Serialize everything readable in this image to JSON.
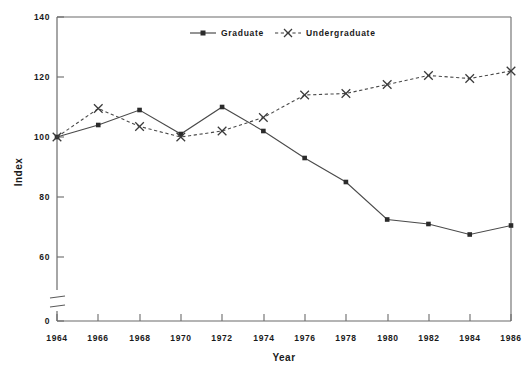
{
  "chart_data": {
    "type": "line",
    "title": "",
    "xlabel": "Year",
    "ylabel": "Index",
    "x": [
      1964,
      1966,
      1968,
      1970,
      1972,
      1974,
      1976,
      1978,
      1980,
      1982,
      1984,
      1986
    ],
    "xtick_labels": [
      "1964",
      "1966",
      "1968",
      "1970",
      "1972",
      "1974",
      "1976",
      "1978",
      "1980",
      "1982",
      "1984",
      "1986"
    ],
    "ytick_labels": [
      "0",
      "60",
      "80",
      "100",
      "120",
      "140"
    ],
    "ytick_values": [
      0,
      60,
      80,
      100,
      120,
      140
    ],
    "ylim": [
      60,
      140
    ],
    "axis_break": true,
    "axis_break_note": "y-axis broken between 0 and 60",
    "grid": false,
    "legend_position": "top-center",
    "series": [
      {
        "name": "Graduate",
        "marker": "square",
        "linestyle": "solid",
        "color": "#3d3d3d",
        "values": [
          100,
          104,
          109,
          101,
          110,
          102,
          93,
          85,
          72.5,
          71,
          67.5,
          70.5
        ]
      },
      {
        "name": "Undergraduate",
        "marker": "x",
        "linestyle": "dashed",
        "color": "#3d3d3d",
        "values": [
          100,
          109.5,
          103.5,
          100,
          102,
          106.5,
          114,
          114.5,
          117.5,
          120.5,
          119.5,
          122
        ]
      }
    ]
  },
  "legend": {
    "entries": [
      {
        "label": "Graduate",
        "marker": "square-marker",
        "style": "solid-line"
      },
      {
        "label": "Undergraduate",
        "marker": "x-marker",
        "style": "dashed-line"
      }
    ]
  },
  "axes": {
    "y_axis_title": "Index",
    "x_axis_title": "Year"
  },
  "colors": {
    "background": "#ffffff",
    "axis": "#6b6b6b",
    "series": "#3d3d3d",
    "text": "#1a1a1a"
  }
}
